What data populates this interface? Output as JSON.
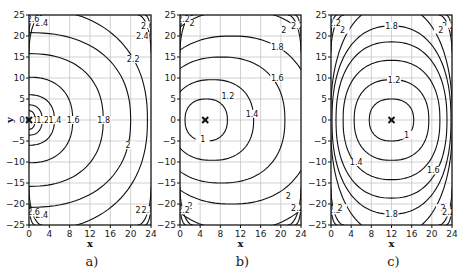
{
  "chart_data": [
    {
      "type": "contour",
      "panel": "a)",
      "caption": "a)",
      "xlabel": "x",
      "ylabel": "y",
      "xlim": [
        0,
        24
      ],
      "ylim": [
        -25,
        25
      ],
      "xticks": [
        "0",
        "4",
        "8",
        "12",
        "16",
        "20",
        "24"
      ],
      "yticks": [
        "25",
        "20",
        "15",
        "10",
        "5",
        "0",
        "-5",
        "-10",
        "-15",
        "-20",
        "-25"
      ],
      "grid": true,
      "marker": {
        "x": 0,
        "y": 0,
        "symbol": "×"
      },
      "levels": [
        "1",
        "1.2",
        "1.4",
        "1.6",
        "1.8",
        "2",
        "2.2",
        "2.4",
        "2.6",
        "2.8"
      ],
      "contours": [
        {
          "level": "1",
          "rx": 1.2,
          "ry": 2.2,
          "cx": 0
        },
        {
          "level": "1.2",
          "rx": 2.6,
          "ry": 3.6,
          "cx": 0
        },
        {
          "level": "1.4",
          "rx": 5.0,
          "ry": 6.0,
          "cx": 0
        },
        {
          "level": "1.6",
          "rx": 8.6,
          "ry": 10.2,
          "cx": 0
        },
        {
          "level": "1.8",
          "rx": 14.6,
          "ry": 15.8,
          "cx": 0
        },
        {
          "level": "2",
          "rx": 20.0,
          "ry": 20.8,
          "cx": 0
        },
        {
          "level": "2.2",
          "rx": 23.3,
          "ry": 26.5,
          "cx": 0
        }
      ],
      "labels": [
        {
          "text": "1",
          "x": 1.3,
          "y": 0
        },
        {
          "text": "1.2",
          "x": 2.7,
          "y": 0
        },
        {
          "text": "1.4",
          "x": 5.1,
          "y": 0
        },
        {
          "text": "1.6",
          "x": 8.7,
          "y": 0
        },
        {
          "text": "1.8",
          "x": 14.7,
          "y": 0
        },
        {
          "text": "2",
          "x": 19.5,
          "y": -6
        },
        {
          "text": "2.2",
          "x": 20.5,
          "y": 14.5
        },
        {
          "text": "2.4",
          "x": 22.3,
          "y": 20
        },
        {
          "text": "2.6",
          "x": 23.3,
          "y": 22.5
        },
        {
          "text": "2.4",
          "x": 2.5,
          "y": 23
        },
        {
          "text": "2.6",
          "x": 0.8,
          "y": 24
        },
        {
          "text": "2.4",
          "x": 2.5,
          "y": -22.5
        },
        {
          "text": "2.6",
          "x": 0.9,
          "y": -22
        },
        {
          "text": "2.4",
          "x": 22.2,
          "y": -21.5
        },
        {
          "text": "2.8",
          "x": 23.4,
          "y": -21.5
        }
      ]
    },
    {
      "type": "contour",
      "panel": "b)",
      "caption": "b)",
      "xlabel": "x",
      "ylabel": "",
      "xlim": [
        0,
        24
      ],
      "ylim": [
        -25,
        25
      ],
      "xticks": [
        "0",
        "4",
        "8",
        "12",
        "16",
        "20",
        "24"
      ],
      "yticks": [
        "25",
        "20",
        "15",
        "10",
        "5",
        "0",
        "-5",
        "-10",
        "-15",
        "-20",
        "-25"
      ],
      "grid": true,
      "marker": {
        "x": 5,
        "y": 0,
        "symbol": "×"
      },
      "levels": [
        "1",
        "1.2",
        "1.4",
        "1.6",
        "1.8",
        "2",
        "2.2"
      ],
      "contours": [
        {
          "level": "1",
          "rx": 4.2,
          "ry": 5.0,
          "cx": 5.2
        },
        {
          "level": "1.2",
          "rx": 8.2,
          "ry": 9.6,
          "cx": 6.4
        },
        {
          "level": "1.4",
          "rx": 12.6,
          "ry": 15.0,
          "cx": 8.2
        },
        {
          "level": "1.6",
          "rx": 16.2,
          "ry": 20.0,
          "cx": 10.2
        },
        {
          "level": "1.8",
          "rx": 19.0,
          "ry": 26.2,
          "cx": 11.6
        }
      ],
      "labels": [
        {
          "text": "1",
          "x": 4.5,
          "y": -4.6
        },
        {
          "text": "1.2",
          "x": 9.5,
          "y": 5.8
        },
        {
          "text": "1.4",
          "x": 14.3,
          "y": 1.5
        },
        {
          "text": "1.6",
          "x": 19.3,
          "y": 10
        },
        {
          "text": "1.8",
          "x": 19.3,
          "y": 17.5
        },
        {
          "text": "2",
          "x": 20.6,
          "y": 21.5
        },
        {
          "text": "2.2",
          "x": 23.3,
          "y": 22.5
        },
        {
          "text": "2",
          "x": 2.4,
          "y": 23
        },
        {
          "text": "2.2",
          "x": 0.7,
          "y": 24
        },
        {
          "text": "2",
          "x": 2.0,
          "y": -20.5
        },
        {
          "text": "2.2",
          "x": 0.7,
          "y": -21.5
        },
        {
          "text": "2",
          "x": 21.5,
          "y": -18
        },
        {
          "text": "2.2",
          "x": 23.3,
          "y": -21
        }
      ]
    },
    {
      "type": "contour",
      "panel": "c)",
      "caption": "c)",
      "xlabel": "x",
      "ylabel": "",
      "xlim": [
        0,
        24
      ],
      "ylim": [
        -25,
        25
      ],
      "xticks": [
        "0",
        "4",
        "8",
        "12",
        "16",
        "20",
        "24"
      ],
      "yticks": [
        "25",
        "20",
        "15",
        "10",
        "5",
        "0",
        "-5",
        "-10",
        "-15",
        "-20",
        "-25"
      ],
      "grid": true,
      "marker": {
        "x": 12,
        "y": 0,
        "symbol": "×"
      },
      "levels": [
        "1",
        "1.2",
        "1.4",
        "1.6",
        "1.8",
        "2",
        "2.2"
      ],
      "contours": [
        {
          "level": "1",
          "rx": 4.4,
          "ry": 5.0,
          "cx": 12
        },
        {
          "level": "1.2",
          "rx": 7.4,
          "ry": 9.6,
          "cx": 12
        },
        {
          "level": "1.4",
          "rx": 9.6,
          "ry": 14.2,
          "cx": 12
        },
        {
          "level": "1.6",
          "rx": 11.0,
          "ry": 18.6,
          "cx": 12
        },
        {
          "level": "1.8",
          "rx": 11.8,
          "ry": 22.4,
          "cx": 12
        },
        {
          "level": "2",
          "rx": 12.1,
          "ry": 27.5,
          "cx": 12
        }
      ],
      "labels": [
        {
          "text": "1",
          "x": 15.0,
          "y": -3.5
        },
        {
          "text": "1.2",
          "x": 12.5,
          "y": 9.6
        },
        {
          "text": "1.4",
          "x": 5.0,
          "y": -10
        },
        {
          "text": "1.6",
          "x": 20.3,
          "y": -12
        },
        {
          "text": "1.8",
          "x": 12.0,
          "y": 22.4
        },
        {
          "text": "1.8",
          "x": 12.0,
          "y": -22.4
        },
        {
          "text": "2",
          "x": 2.3,
          "y": 21.5
        },
        {
          "text": "2.2",
          "x": 0.7,
          "y": 23
        },
        {
          "text": "2.2",
          "x": 23.3,
          "y": 22.5
        },
        {
          "text": "2",
          "x": 21.8,
          "y": 21.5
        },
        {
          "text": "2.2",
          "x": 0.7,
          "y": -21.5
        },
        {
          "text": "2",
          "x": 1.8,
          "y": -21
        },
        {
          "text": "2",
          "x": 22.2,
          "y": -21
        },
        {
          "text": "2.2",
          "x": 23.3,
          "y": -22
        }
      ]
    }
  ],
  "layout": {
    "panels": [
      {
        "left": 29,
        "right": 151,
        "top": 15,
        "bottom": 225
      },
      {
        "left": 180,
        "right": 301,
        "top": 15,
        "bottom": 225
      },
      {
        "left": 331,
        "right": 452,
        "top": 15,
        "bottom": 225
      }
    ]
  }
}
